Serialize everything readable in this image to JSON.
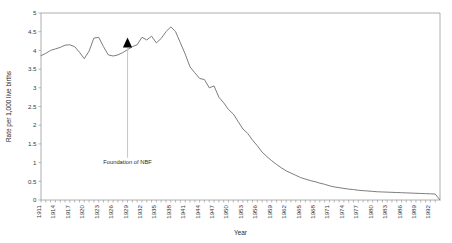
{
  "chart_data": {
    "type": "line",
    "title": "",
    "xlabel": "Year",
    "ylabel": "Rate per 1,000 live births",
    "xlim": [
      1911,
      1994
    ],
    "ylim": [
      0,
      5
    ],
    "grid": false,
    "legend": false,
    "y_ticks": [
      0,
      0.5,
      1,
      1.5,
      2,
      2.5,
      3,
      3.5,
      4,
      4.5,
      5
    ],
    "y_tick_labels": [
      "0",
      "0.5",
      "1",
      "1.5",
      "2",
      "2.5",
      "3",
      "3.5",
      "4",
      "4.5",
      "5"
    ],
    "x_tick_labels": [
      "1911",
      "1914",
      "1917",
      "1920",
      "1923",
      "1926",
      "1929",
      "1932",
      "1935",
      "1938",
      "1941",
      "1944",
      "1947",
      "1950",
      "1953",
      "1956",
      "1959",
      "1962",
      "1965",
      "1968",
      "1971",
      "1974",
      "1977",
      "1980",
      "1983",
      "1986",
      "1989",
      "1992"
    ],
    "x_tick_step": 3,
    "x_minor_tick_step": 1,
    "series": [
      {
        "name": "Maternal mortality rate",
        "x": [
          1911,
          1912,
          1913,
          1914,
          1915,
          1916,
          1917,
          1918,
          1919,
          1920,
          1921,
          1922,
          1923,
          1924,
          1925,
          1926,
          1927,
          1928,
          1929,
          1930,
          1931,
          1932,
          1933,
          1934,
          1935,
          1936,
          1937,
          1938,
          1939,
          1940,
          1941,
          1942,
          1943,
          1944,
          1945,
          1946,
          1947,
          1948,
          1949,
          1950,
          1951,
          1952,
          1953,
          1954,
          1955,
          1956,
          1957,
          1958,
          1959,
          1960,
          1961,
          1962,
          1963,
          1964,
          1965,
          1966,
          1967,
          1968,
          1969,
          1970,
          1971,
          1972,
          1973,
          1974,
          1975,
          1976,
          1977,
          1978,
          1979,
          1980,
          1981,
          1982,
          1983,
          1984,
          1985,
          1986,
          1987,
          1988,
          1989,
          1990,
          1991,
          1992,
          1993,
          1994
        ],
        "values": [
          3.86,
          3.92,
          4.0,
          4.04,
          4.08,
          4.14,
          4.15,
          4.1,
          3.95,
          3.78,
          3.98,
          4.33,
          4.35,
          4.1,
          3.88,
          3.85,
          3.88,
          3.94,
          4.02,
          4.1,
          4.15,
          4.35,
          4.28,
          4.38,
          4.2,
          4.32,
          4.5,
          4.63,
          4.5,
          4.2,
          3.9,
          3.56,
          3.4,
          3.25,
          3.22,
          3.0,
          3.05,
          2.75,
          2.6,
          2.42,
          2.3,
          2.1,
          1.9,
          1.78,
          1.6,
          1.45,
          1.28,
          1.16,
          1.05,
          0.95,
          0.86,
          0.78,
          0.72,
          0.66,
          0.6,
          0.56,
          0.52,
          0.49,
          0.45,
          0.42,
          0.38,
          0.35,
          0.33,
          0.31,
          0.29,
          0.28,
          0.26,
          0.25,
          0.24,
          0.23,
          0.22,
          0.215,
          0.21,
          0.205,
          0.2,
          0.195,
          0.19,
          0.185,
          0.18,
          0.175,
          0.17,
          0.165,
          0.16,
          0.0
        ]
      }
    ],
    "annotations": [
      {
        "label": "Foundation of NBF",
        "x": 1929,
        "marker_y": 4.12,
        "label_y": 0.97,
        "marker": "up-triangle"
      }
    ]
  }
}
